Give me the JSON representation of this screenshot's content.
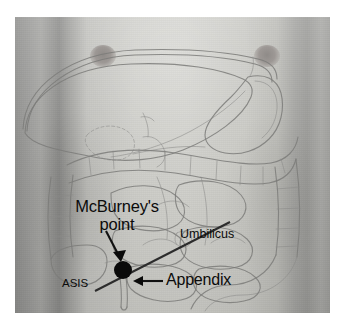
{
  "figure": {
    "kind": "anatomical-photo-overlay",
    "canvas": {
      "width": 348,
      "height": 330,
      "background": "#ffffff"
    },
    "photo": {
      "x": 15,
      "y": 17,
      "width": 315,
      "height": 296
    }
  },
  "labels": {
    "mcburney": "McBurney's\npoint",
    "mcburney_line1": "McBurney's",
    "mcburney_line2": "point",
    "umbilicus": "Umbilicus",
    "asis": "ASIS",
    "appendix": "Appendix"
  },
  "markers": {
    "mcburney_point": {
      "name": "mcburney-point-dot",
      "x": 123,
      "y": 270,
      "radius": 9,
      "color": "#0a0a0a"
    },
    "mcburney_line": {
      "name": "asis-to-umbilicus-line",
      "from": {
        "x": 95,
        "y": 291
      },
      "to": {
        "x": 230,
        "y": 222
      },
      "color": "#2c2c2c"
    }
  },
  "arrows": [
    {
      "name": "mcburney-arrow",
      "from": {
        "x": 107,
        "y": 232
      },
      "to": {
        "x": 121,
        "y": 259
      }
    },
    {
      "name": "appendix-arrow",
      "from": {
        "x": 163,
        "y": 281
      },
      "to": {
        "x": 134,
        "y": 281
      }
    }
  ],
  "anatomy_features": [
    "liver",
    "stomach",
    "transverse-colon",
    "ascending-colon",
    "descending-colon",
    "small-intestine",
    "cecum",
    "appendix",
    "diaphragm",
    "nipple-left",
    "nipple-right",
    "umbilicus"
  ],
  "colors": {
    "annotation": "#0b0b0b",
    "line_art": "#7b7b79",
    "skin_light": "#d2d2cd",
    "skin_shadow": "#9a9a98",
    "photo_border": "#ffffff"
  }
}
